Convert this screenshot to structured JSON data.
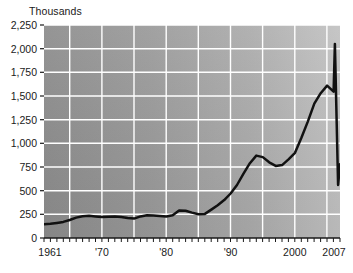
{
  "chart_data": {
    "type": "line",
    "title": "Thousands",
    "xlabel": "",
    "ylabel": "Thousands",
    "ylim": [
      0,
      2250
    ],
    "xlim": [
      1961,
      2007
    ],
    "grid": true,
    "legend": false,
    "y_ticks": [
      "2,250",
      "2,000",
      "1,750",
      "1,500",
      "1,250",
      "1,000",
      "750",
      "500",
      "250",
      "0"
    ],
    "y_tick_values": [
      2250,
      2000,
      1750,
      1500,
      1250,
      1000,
      750,
      500,
      250,
      0
    ],
    "x_ticks": [
      "1961",
      "'70",
      "'80",
      "'90",
      "2000",
      "2007"
    ],
    "x_tick_values": [
      1961,
      1970,
      1980,
      1990,
      2000,
      2007
    ],
    "x_gridline_values": [
      1965,
      1970,
      1975,
      1980,
      1985,
      1990,
      1995,
      2000,
      2005
    ],
    "series": [
      {
        "name": "value",
        "color": "#111111",
        "x": [
          1961,
          1962,
          1963,
          1964,
          1965,
          1966,
          1967,
          1968,
          1969,
          1970,
          1971,
          1972,
          1973,
          1974,
          1975,
          1976,
          1977,
          1978,
          1979,
          1980,
          1981,
          1982,
          1983,
          1984,
          1985,
          1986,
          1987,
          1988,
          1989,
          1990,
          1991,
          1992,
          1993,
          1994,
          1995,
          1996,
          1997,
          1998,
          1999,
          2000,
          2001,
          2002,
          2003,
          2004,
          2005,
          2006,
          2007
        ],
        "values": [
          145,
          150,
          160,
          170,
          190,
          215,
          230,
          235,
          228,
          222,
          225,
          228,
          222,
          212,
          205,
          228,
          240,
          238,
          232,
          228,
          240,
          290,
          288,
          268,
          250,
          255,
          300,
          345,
          400,
          470,
          560,
          680,
          790,
          870,
          855,
          800,
          762,
          770,
          830,
          900,
          1060,
          1230,
          1340,
          1370,
          1280,
          1195,
          1240
        ]
      },
      {
        "name": "value-tail",
        "color": "#111111",
        "x": [
          2003,
          2004,
          2005,
          2006,
          2007
        ],
        "values": [
          1420,
          1530,
          1610,
          1545,
          2050
        ]
      }
    ],
    "annotations": [
      {
        "label": "peak",
        "value": 2050
      },
      {
        "label": "trough-after-peak",
        "value": 560
      },
      {
        "label": "final",
        "value": 780
      }
    ]
  },
  "style": {
    "plot_bg_left": "#8f8f8f",
    "plot_bg_right": "#bdbdbd",
    "gridline_color": "#ffffff",
    "line_color": "#111111",
    "text_color": "#1a1a1a"
  }
}
